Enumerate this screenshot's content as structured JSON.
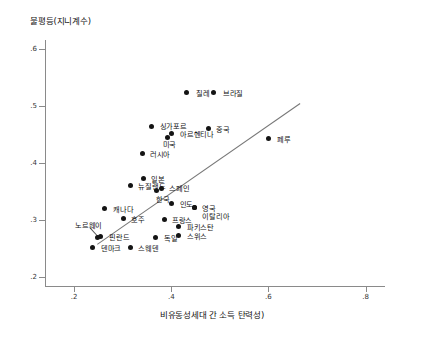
{
  "chart_data": {
    "type": "scatter",
    "title": "",
    "ylabel": "불평등(지니계수)",
    "xlabel": "비유동성세대 간 소득 탄력성)",
    "xlim": [
      0.14,
      0.84
    ],
    "ylim": [
      0.185,
      0.615
    ],
    "xticks": [
      ".2",
      ".4",
      ".6",
      ".8"
    ],
    "xtick_values": [
      0.2,
      0.4,
      0.6,
      0.8
    ],
    "yticks": [
      ".2",
      ".3",
      ".4",
      ".5",
      ".6"
    ],
    "ytick_values": [
      0.2,
      0.3,
      0.4,
      0.5,
      0.6
    ],
    "grid": false,
    "legend": "none",
    "trendline": {
      "x0": 0.248,
      "y0": 0.258,
      "x1": 0.665,
      "y1": 0.504
    },
    "points": [
      {
        "label": "칠레",
        "x": 0.431,
        "y": 0.523,
        "lx": 0.451,
        "ly": 0.523,
        "anchor": "left"
      },
      {
        "label": "브라질",
        "x": 0.486,
        "y": 0.523,
        "lx": 0.506,
        "ly": 0.523,
        "anchor": "left"
      },
      {
        "label": "싱가포르",
        "x": 0.36,
        "y": 0.463,
        "lx": 0.376,
        "ly": 0.466,
        "anchor": "left"
      },
      {
        "label": "아르헨티나",
        "x": 0.401,
        "y": 0.452,
        "lx": 0.418,
        "ly": 0.452,
        "anchor": "left"
      },
      {
        "label": "미국",
        "x": 0.392,
        "y": 0.445,
        "lx": 0.382,
        "ly": 0.434,
        "anchor": "left"
      },
      {
        "label": "중국",
        "x": 0.476,
        "y": 0.46,
        "lx": 0.492,
        "ly": 0.46,
        "anchor": "left"
      },
      {
        "label": "페루",
        "x": 0.601,
        "y": 0.443,
        "lx": 0.618,
        "ly": 0.443,
        "anchor": "left"
      },
      {
        "label": "러시아",
        "x": 0.34,
        "y": 0.417,
        "lx": 0.356,
        "ly": 0.417,
        "anchor": "left"
      },
      {
        "label": "일본",
        "x": 0.343,
        "y": 0.373,
        "lx": 0.359,
        "ly": 0.373,
        "anchor": "left"
      },
      {
        "label": "뉴질랜드",
        "x": 0.316,
        "y": 0.361,
        "lx": 0.332,
        "ly": 0.361,
        "anchor": "left"
      },
      {
        "label": "스페인",
        "x": 0.379,
        "y": 0.355,
        "lx": 0.396,
        "ly": 0.357,
        "anchor": "left"
      },
      {
        "label": "한국",
        "x": 0.369,
        "y": 0.352,
        "lx": 0.369,
        "ly": 0.338,
        "anchor": "left"
      },
      {
        "label": "인도",
        "x": 0.4,
        "y": 0.33,
        "lx": 0.417,
        "ly": 0.33,
        "anchor": "left"
      },
      {
        "label": "영국",
        "x": 0.447,
        "y": 0.322,
        "lx": 0.464,
        "ly": 0.322,
        "anchor": "left"
      },
      {
        "label": "이탈리아",
        "x": 0.447,
        "y": 0.322,
        "lx": 0.464,
        "ly": 0.308,
        "anchor": "left"
      },
      {
        "label": "프랑스",
        "x": 0.385,
        "y": 0.301,
        "lx": 0.401,
        "ly": 0.301,
        "anchor": "left"
      },
      {
        "label": "파키스탄",
        "x": 0.415,
        "y": 0.289,
        "lx": 0.432,
        "ly": 0.289,
        "anchor": "left"
      },
      {
        "label": "스위스",
        "x": 0.415,
        "y": 0.274,
        "lx": 0.432,
        "ly": 0.274,
        "anchor": "left"
      },
      {
        "label": "캐나다",
        "x": 0.263,
        "y": 0.32,
        "lx": 0.28,
        "ly": 0.32,
        "anchor": "left"
      },
      {
        "label": "호주",
        "x": 0.301,
        "y": 0.303,
        "lx": 0.317,
        "ly": 0.303,
        "anchor": "left"
      },
      {
        "label": "핀란드",
        "x": 0.254,
        "y": 0.271,
        "lx": 0.272,
        "ly": 0.271,
        "anchor": "left"
      },
      {
        "label": "노르웨이",
        "x": 0.249,
        "y": 0.269,
        "lx": 0.202,
        "ly": 0.292,
        "anchor": "left"
      },
      {
        "label": "덴마크",
        "x": 0.238,
        "y": 0.253,
        "lx": 0.255,
        "ly": 0.253,
        "anchor": "left"
      },
      {
        "label": "스웨덴",
        "x": 0.315,
        "y": 0.253,
        "lx": 0.332,
        "ly": 0.253,
        "anchor": "left"
      },
      {
        "label": "독일",
        "x": 0.368,
        "y": 0.27,
        "lx": 0.385,
        "ly": 0.27,
        "anchor": "left"
      }
    ],
    "leaders": [
      {
        "x0": 0.232,
        "y0": 0.288,
        "x1": 0.249,
        "y1": 0.272
      }
    ]
  }
}
